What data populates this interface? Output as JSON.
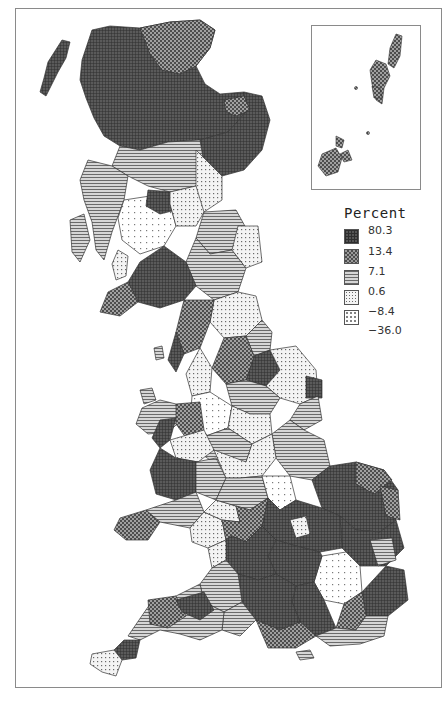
{
  "legend": {
    "title": "Percent",
    "boundaries": [
      "80.3",
      "13.4",
      "7.1",
      "0.6",
      "−8.4",
      "−36.0"
    ],
    "classes": [
      {
        "range": "13.4 to 80.3",
        "pattern": "dense-grid",
        "color": "#4a4a4a"
      },
      {
        "range": "7.1 to 13.4",
        "pattern": "checker",
        "color": "#7a7a7a"
      },
      {
        "range": "0.6 to 7.1",
        "pattern": "horizontal-lines",
        "color": "#9a9a9a"
      },
      {
        "range": "-8.4 to 0.6",
        "pattern": "fine-dots",
        "color": "#c4c4c4"
      },
      {
        "range": "-36.0 to -8.4",
        "pattern": "sparse-dots",
        "color": "#e2e2e2"
      }
    ]
  },
  "map": {
    "subject": "Great Britain districts choropleth",
    "inset": "Shetland and Orkney Islands"
  }
}
